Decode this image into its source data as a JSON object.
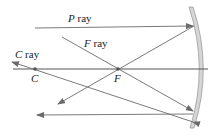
{
  "diagram": {
    "labels": {
      "p_ray_letter": "P",
      "f_ray_letter": "F",
      "c_ray_letter": "C",
      "ray_word": " ray",
      "center_point": "C",
      "focal_point": "F"
    },
    "colors": {
      "ray": "#6b6b6b",
      "axis": "#555555",
      "mirror_fill": "#d6d6d6",
      "mirror_edge": "#9a9a9a",
      "point": "#555555"
    }
  }
}
